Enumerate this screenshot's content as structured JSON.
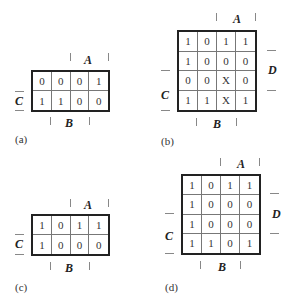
{
  "maps": [
    {
      "id": "a",
      "caption": "(a)",
      "rows": 2,
      "cols": 4,
      "cells": [
        [
          "0",
          "0",
          "0",
          "1"
        ],
        [
          "1",
          "1",
          "0",
          "0"
        ]
      ],
      "labels": {
        "A": "A",
        "B": "B",
        "C": "C"
      }
    },
    {
      "id": "b",
      "caption": "(b)",
      "rows": 4,
      "cols": 4,
      "cells": [
        [
          "1",
          "0",
          "1",
          "1"
        ],
        [
          "1",
          "0",
          "0",
          "0"
        ],
        [
          "0",
          "0",
          "X",
          "0"
        ],
        [
          "1",
          "1",
          "X",
          "1"
        ]
      ],
      "labels": {
        "A": "A",
        "B": "B",
        "C": "C",
        "D": "D"
      }
    },
    {
      "id": "c",
      "caption": "(c)",
      "rows": 2,
      "cols": 4,
      "cells": [
        [
          "1",
          "0",
          "1",
          "1"
        ],
        [
          "1",
          "0",
          "0",
          "0"
        ]
      ],
      "labels": {
        "A": "A",
        "B": "B",
        "C": "C"
      }
    },
    {
      "id": "d",
      "caption": "(d)",
      "rows": 4,
      "cols": 4,
      "cells": [
        [
          "1",
          "0",
          "1",
          "1"
        ],
        [
          "1",
          "0",
          "0",
          "0"
        ],
        [
          "1",
          "0",
          "0",
          "0"
        ],
        [
          "1",
          "1",
          "0",
          "1"
        ]
      ],
      "labels": {
        "A": "A",
        "B": "B",
        "C": "C",
        "D": "D"
      }
    }
  ]
}
